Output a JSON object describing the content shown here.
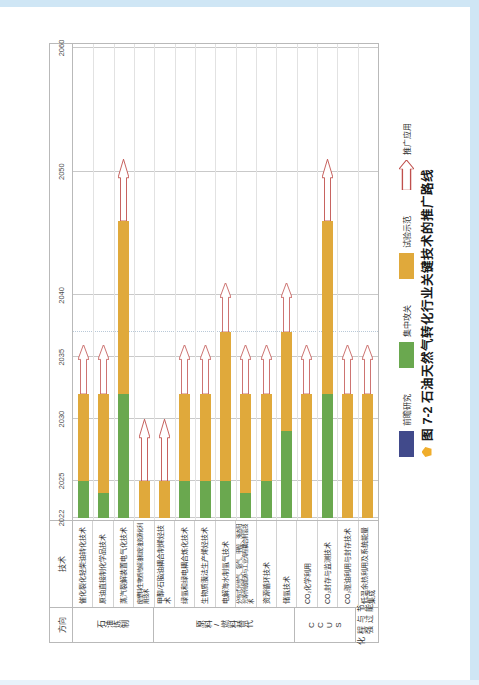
{
  "figure": {
    "caption_number": "图 7-2",
    "caption_text": "石油天然气转化行业关键技术的推广路线",
    "caption_dot_color": "#f0ad2b"
  },
  "table": {
    "header_direction": "方向",
    "header_tech": "技术",
    "year_ticks": [
      "2022",
      "2025",
      "2030",
      "2035",
      "2040",
      "2050",
      "2060"
    ]
  },
  "legend": {
    "items": [
      {
        "label": "前瞻研究",
        "swatch": "blue",
        "color": "#414a8b"
      },
      {
        "label": "集中攻关",
        "swatch": "green",
        "color": "#6aa84f"
      },
      {
        "label": "试验示范",
        "swatch": "amber",
        "color": "#e0a93b"
      },
      {
        "label": "推广应用",
        "swatch": "arrow",
        "color": "#c0504d"
      }
    ]
  },
  "chart_data": {
    "type": "bar",
    "title": "石油天然气转化行业关键技术的推广路线",
    "xlabel": "",
    "ylabel": "",
    "xlim": [
      2022,
      2060
    ],
    "grid": true,
    "legend_position": "bottom-left",
    "orientation": "horizontal-stacked-timeline",
    "year_ticks": [
      2022,
      2025,
      2030,
      2035,
      2040,
      2050,
      2060
    ],
    "groups": [
      {
        "name": "石油炼制",
        "rows": [
          0,
          1,
          2,
          3
        ]
      },
      {
        "name": "原料/燃料替代",
        "rows": [
          4,
          5,
          6,
          7,
          8,
          9,
          10
        ]
      },
      {
        "name": "CCUS",
        "rows": [
          11,
          12,
          13
        ]
      },
      {
        "name": "节能与过程强化",
        "rows": [
          14
        ]
      }
    ],
    "categories": [
      "催化裂化轻柴油转化技术",
      "原油直接制化学品技术",
      "蒸汽裂解装置电气化技术",
      "废塑料/生物质热解油和废油资源化利用技术",
      "甲醇/石脑油耦合制烯烃技术",
      "绿氢和绿电耦合炼化技术",
      "生物质膜法生产烯烃技术",
      "电解海水制氢气技术",
      "分布式光热气、氨气、甲醇、液态阳光等传统能源与工业流程耦合制氢技术",
      "资源循环技术",
      "储氢技术",
      "CO₂化学利用",
      "CO₂封存与监测技术",
      "CO₂驱油利用与封存技术",
      "低温余热利用及系统能量集成"
    ],
    "series": [
      {
        "name": "集中攻关",
        "color": "#6aa84f"
      },
      {
        "name": "试验示范",
        "color": "#e0a93b"
      },
      {
        "name": "推广应用",
        "color": "#c0504d"
      }
    ],
    "bars": [
      {
        "tech": "催化裂化轻柴油转化技术",
        "green_start": 2022,
        "green_end": 2025,
        "amber_start": 2025,
        "amber_end": 2032,
        "arrow_start": 2032,
        "arrow_end": 2036
      },
      {
        "tech": "原油直接制化学品技术",
        "green_start": 2022,
        "green_end": 2024,
        "amber_start": 2024,
        "amber_end": 2032,
        "arrow_start": 2032,
        "arrow_end": 2036
      },
      {
        "tech": "蒸汽裂解装置电气化技术",
        "green_start": 2022,
        "green_end": 2032,
        "amber_start": 2032,
        "amber_end": 2046,
        "arrow_start": 2046,
        "arrow_end": 2051
      },
      {
        "tech": "废塑料/生物质热解油和废油资源化利用技术",
        "green_start": null,
        "green_end": null,
        "amber_start": 2022,
        "amber_end": 2025,
        "arrow_start": 2025,
        "arrow_end": 2030
      },
      {
        "tech": "甲醇/石脑油耦合制烯烃技术",
        "green_start": null,
        "green_end": null,
        "amber_start": 2022,
        "amber_end": 2025,
        "arrow_start": 2025,
        "arrow_end": 2030
      },
      {
        "tech": "绿氢和绿电耦合炼化技术",
        "green_start": 2022,
        "green_end": 2025,
        "amber_start": 2025,
        "amber_end": 2032,
        "arrow_start": 2032,
        "arrow_end": 2036
      },
      {
        "tech": "生物质膜法生产烯烃技术",
        "green_start": 2022,
        "green_end": 2025,
        "amber_start": 2025,
        "amber_end": 2032,
        "arrow_start": 2032,
        "arrow_end": 2036
      },
      {
        "tech": "电解海水制氢气技术",
        "green_start": 2022,
        "green_end": 2025,
        "amber_start": 2025,
        "amber_end": 2037,
        "arrow_start": 2037,
        "arrow_end": 2041
      },
      {
        "tech": "分布式光热气、氨气、甲醇、液态阳光等传统能源与工业流程耦合制氢技术",
        "green_start": 2022,
        "green_end": 2024,
        "amber_start": 2024,
        "amber_end": 2032,
        "arrow_start": 2032,
        "arrow_end": 2036
      },
      {
        "tech": "资源循环技术",
        "green_start": 2022,
        "green_end": 2025,
        "amber_start": 2025,
        "amber_end": 2032,
        "arrow_start": 2032,
        "arrow_end": 2036
      },
      {
        "tech": "储氢技术",
        "green_start": 2022,
        "green_end": 2029,
        "amber_start": 2029,
        "amber_end": 2037,
        "arrow_start": 2037,
        "arrow_end": 2041
      },
      {
        "tech": "CO₂化学利用",
        "green_start": null,
        "green_end": null,
        "amber_start": 2022,
        "amber_end": 2032,
        "arrow_start": 2032,
        "arrow_end": 2036
      },
      {
        "tech": "CO₂封存与监测技术",
        "green_start": 2022,
        "green_end": 2032,
        "amber_start": 2032,
        "amber_end": 2046,
        "arrow_start": 2046,
        "arrow_end": 2051
      },
      {
        "tech": "CO₂驱油利用与封存技术",
        "green_start": null,
        "green_end": null,
        "amber_start": 2022,
        "amber_end": 2032,
        "arrow_start": 2032,
        "arrow_end": 2036
      },
      {
        "tech": "低温余热利用及系统能量集成",
        "green_start": null,
        "green_end": null,
        "amber_start": 2022,
        "amber_end": 2032,
        "arrow_start": 2032,
        "arrow_end": 2036
      }
    ]
  }
}
